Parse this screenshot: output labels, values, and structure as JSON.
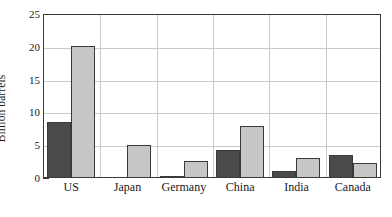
{
  "chart_data": {
    "type": "bar",
    "title": "",
    "xlabel": "",
    "ylabel": "Billion barrels",
    "ylim": [
      0,
      25
    ],
    "yticks": [
      0,
      5,
      10,
      15,
      20,
      25
    ],
    "ytick_labels": [
      "0",
      "5",
      "10",
      "15",
      "20",
      "25"
    ],
    "y_minor_tick_interval": 1,
    "grid": "both",
    "legend": "none",
    "categories": [
      "US",
      "Japan",
      "Germany",
      "China",
      "India",
      "Canada"
    ],
    "series": [
      {
        "name": "dark-series",
        "color": "#4a4a4a",
        "values": [
          8.5,
          0,
          0.3,
          4.2,
          1.0,
          3.5
        ]
      },
      {
        "name": "light-series",
        "color": "#c6c6c6",
        "values": [
          20.1,
          5.1,
          2.6,
          8.0,
          3.0,
          2.3
        ]
      }
    ],
    "annotations": []
  },
  "axis": {
    "y_title": "Billion barrels",
    "y_labels": [
      "25",
      "20",
      "15",
      "10",
      "5",
      "0"
    ],
    "x_labels": [
      "US",
      "Japan",
      "Germany",
      "China",
      "India",
      "Canada"
    ]
  },
  "colors": {
    "dark_bar": "#4a4a4a",
    "light_bar": "#c6c6c6",
    "gridline": "#c9c9c9",
    "axis_line": "#3a3a3a",
    "background": "#ffffff",
    "text": "#1a1a1a"
  }
}
